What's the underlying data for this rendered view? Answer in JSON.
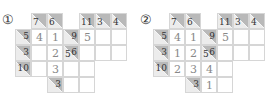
{
  "colors": {
    "clue_bg": "#ececec",
    "clue_shade": "#b9b9b9",
    "grid_line": "#d6d6d6",
    "value_text": "#888888",
    "clue_text": "#333333"
  },
  "puzzles": [
    {
      "label": "①",
      "cells": [
        {
          "r": 0,
          "c": 1,
          "type": "clue",
          "down": "7"
        },
        {
          "r": 0,
          "c": 2,
          "type": "clue",
          "down": "6"
        },
        {
          "r": 0,
          "c": 4,
          "type": "clue",
          "down": "11"
        },
        {
          "r": 0,
          "c": 5,
          "type": "clue",
          "down": "3"
        },
        {
          "r": 0,
          "c": 6,
          "type": "clue",
          "down": "4"
        },
        {
          "r": 1,
          "c": 0,
          "type": "clue",
          "right": "5"
        },
        {
          "r": 1,
          "c": 1,
          "type": "white",
          "value": "4"
        },
        {
          "r": 1,
          "c": 2,
          "type": "white",
          "value": "1"
        },
        {
          "r": 1,
          "c": 3,
          "type": "clue",
          "right": "9"
        },
        {
          "r": 1,
          "c": 4,
          "type": "white",
          "value": "5"
        },
        {
          "r": 1,
          "c": 5,
          "type": "white",
          "value": ""
        },
        {
          "r": 1,
          "c": 6,
          "type": "white",
          "value": ""
        },
        {
          "r": 2,
          "c": 0,
          "type": "clue",
          "right": "3"
        },
        {
          "r": 2,
          "c": 1,
          "type": "white",
          "value": ""
        },
        {
          "r": 2,
          "c": 2,
          "type": "white",
          "value": "2"
        },
        {
          "r": 2,
          "c": 3,
          "type": "clue",
          "down": "5",
          "right": "6"
        },
        {
          "r": 2,
          "c": 4,
          "type": "white",
          "value": ""
        },
        {
          "r": 2,
          "c": 5,
          "type": "white",
          "value": ""
        },
        {
          "r": 2,
          "c": 6,
          "type": "white",
          "value": ""
        },
        {
          "r": 3,
          "c": 0,
          "type": "clue",
          "right": "10"
        },
        {
          "r": 3,
          "c": 1,
          "type": "white",
          "value": ""
        },
        {
          "r": 3,
          "c": 2,
          "type": "white",
          "value": "3"
        },
        {
          "r": 3,
          "c": 3,
          "type": "white",
          "value": ""
        },
        {
          "r": 3,
          "c": 4,
          "type": "white",
          "value": ""
        },
        {
          "r": 4,
          "c": 2,
          "type": "clue",
          "right": "3"
        },
        {
          "r": 4,
          "c": 3,
          "type": "white",
          "value": ""
        },
        {
          "r": 4,
          "c": 4,
          "type": "white",
          "value": ""
        }
      ]
    },
    {
      "label": "②",
      "cells": [
        {
          "r": 0,
          "c": 1,
          "type": "clue",
          "down": "7"
        },
        {
          "r": 0,
          "c": 2,
          "type": "clue",
          "down": "6"
        },
        {
          "r": 0,
          "c": 4,
          "type": "clue",
          "down": "11"
        },
        {
          "r": 0,
          "c": 5,
          "type": "clue",
          "down": "3"
        },
        {
          "r": 0,
          "c": 6,
          "type": "clue",
          "down": "4"
        },
        {
          "r": 1,
          "c": 0,
          "type": "clue",
          "right": "5"
        },
        {
          "r": 1,
          "c": 1,
          "type": "white",
          "value": "4"
        },
        {
          "r": 1,
          "c": 2,
          "type": "white",
          "value": "1"
        },
        {
          "r": 1,
          "c": 3,
          "type": "clue",
          "right": "9"
        },
        {
          "r": 1,
          "c": 4,
          "type": "white",
          "value": "5"
        },
        {
          "r": 1,
          "c": 5,
          "type": "white",
          "value": ""
        },
        {
          "r": 1,
          "c": 6,
          "type": "white",
          "value": ""
        },
        {
          "r": 2,
          "c": 0,
          "type": "clue",
          "right": "3"
        },
        {
          "r": 2,
          "c": 1,
          "type": "white",
          "value": "1"
        },
        {
          "r": 2,
          "c": 2,
          "type": "white",
          "value": "2"
        },
        {
          "r": 2,
          "c": 3,
          "type": "clue",
          "down": "5",
          "right": "6"
        },
        {
          "r": 2,
          "c": 4,
          "type": "white",
          "value": ""
        },
        {
          "r": 2,
          "c": 5,
          "type": "white",
          "value": ""
        },
        {
          "r": 2,
          "c": 6,
          "type": "white",
          "value": ""
        },
        {
          "r": 3,
          "c": 0,
          "type": "clue",
          "right": "10"
        },
        {
          "r": 3,
          "c": 1,
          "type": "white",
          "value": "2"
        },
        {
          "r": 3,
          "c": 2,
          "type": "white",
          "value": "3"
        },
        {
          "r": 3,
          "c": 3,
          "type": "white",
          "value": "4"
        },
        {
          "r": 3,
          "c": 4,
          "type": "white",
          "value": ""
        },
        {
          "r": 4,
          "c": 2,
          "type": "clue",
          "right": "3"
        },
        {
          "r": 4,
          "c": 3,
          "type": "white",
          "value": "1"
        },
        {
          "r": 4,
          "c": 4,
          "type": "white",
          "value": ""
        }
      ]
    }
  ]
}
